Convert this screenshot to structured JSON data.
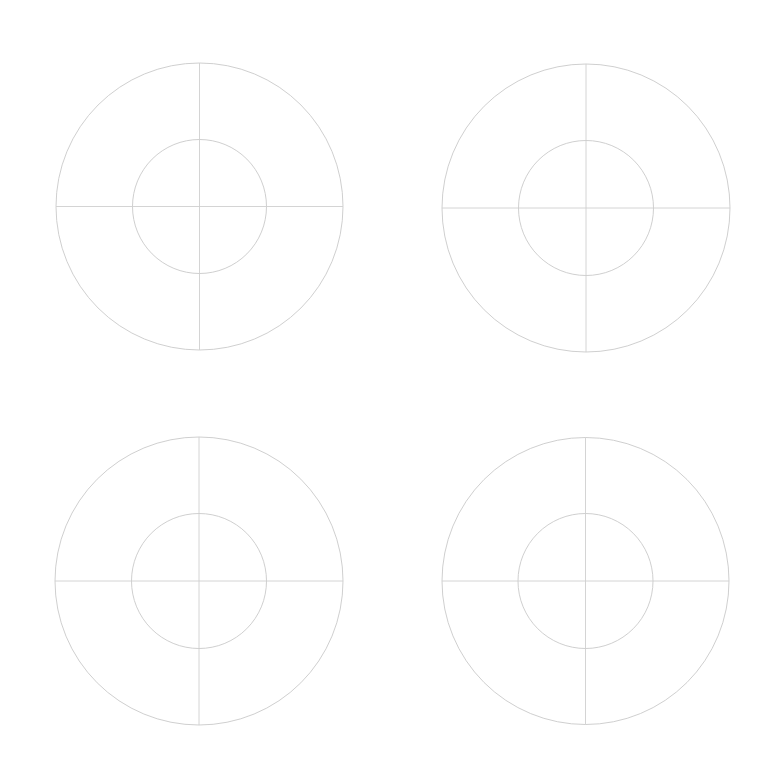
{
  "page": {
    "width": 780,
    "height": 781,
    "background": "#ffffff"
  },
  "style": {
    "line_color": "#cfcfcf",
    "circle_color": "#c9c9c9"
  },
  "targets": [
    {
      "id": "top-left",
      "cx": 199.5,
      "cy": 206.5,
      "r_outer": 143.5,
      "r_inner": 67
    },
    {
      "id": "top-right",
      "cx": 586,
      "cy": 208,
      "r_outer": 144,
      "r_inner": 67.5
    },
    {
      "id": "bottom-left",
      "cx": 199,
      "cy": 581,
      "r_outer": 144,
      "r_inner": 67.5
    },
    {
      "id": "bottom-right",
      "cx": 585.5,
      "cy": 581,
      "r_outer": 143.5,
      "r_inner": 67.5
    }
  ]
}
